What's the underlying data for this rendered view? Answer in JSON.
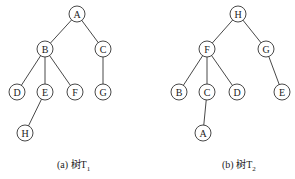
{
  "trees": [
    {
      "id": "T1",
      "caption_prefix": "(a) 树T",
      "caption_sub": "1",
      "nodes": [
        {
          "id": "A",
          "x": 77,
          "y": 14
        },
        {
          "id": "B",
          "x": 45,
          "y": 49
        },
        {
          "id": "C",
          "x": 103,
          "y": 49
        },
        {
          "id": "D",
          "x": 17,
          "y": 92
        },
        {
          "id": "E",
          "x": 45,
          "y": 92
        },
        {
          "id": "F",
          "x": 75,
          "y": 92
        },
        {
          "id": "G",
          "x": 103,
          "y": 92
        },
        {
          "id": "H",
          "x": 25,
          "y": 133
        }
      ],
      "edges": [
        [
          "A",
          "B"
        ],
        [
          "A",
          "C"
        ],
        [
          "B",
          "D"
        ],
        [
          "B",
          "E"
        ],
        [
          "B",
          "F"
        ],
        [
          "C",
          "G"
        ],
        [
          "E",
          "H"
        ]
      ]
    },
    {
      "id": "T2",
      "caption_prefix": "(b) 树T",
      "caption_sub": "2",
      "nodes": [
        {
          "id": "H",
          "x": 238,
          "y": 14
        },
        {
          "id": "F",
          "x": 207,
          "y": 49
        },
        {
          "id": "G",
          "x": 266,
          "y": 49
        },
        {
          "id": "B",
          "x": 179,
          "y": 92
        },
        {
          "id": "C",
          "x": 207,
          "y": 92
        },
        {
          "id": "D",
          "x": 237,
          "y": 92
        },
        {
          "id": "E",
          "x": 282,
          "y": 92
        },
        {
          "id": "A",
          "x": 203,
          "y": 133
        }
      ],
      "edges": [
        [
          "H",
          "F"
        ],
        [
          "H",
          "G"
        ],
        [
          "F",
          "B"
        ],
        [
          "F",
          "C"
        ],
        [
          "F",
          "D"
        ],
        [
          "G",
          "E"
        ],
        [
          "C",
          "A"
        ]
      ]
    }
  ],
  "style": {
    "node_radius": 8,
    "stroke": "#333333"
  }
}
